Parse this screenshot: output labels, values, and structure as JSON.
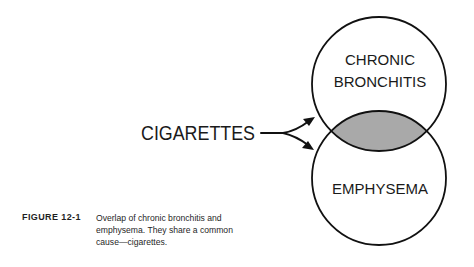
{
  "figure": {
    "number": "FIGURE 12-1",
    "caption": "Overlap of chronic bronchitis and emphysema. They share a common cause—cigarettes."
  },
  "diagram": {
    "type": "venn",
    "cause_label": "CIGARETTES",
    "sets": [
      {
        "id": "top",
        "label_lines": [
          "CHRONIC",
          "BRONCHITIS"
        ]
      },
      {
        "id": "bottom",
        "label_lines": [
          "EMPHYSEMA"
        ]
      }
    ],
    "overlap": {
      "fill": "#a9a9a9",
      "meaning": "shared condition"
    },
    "colors": {
      "stroke": "#111111",
      "background": "#ffffff",
      "overlap": "#a9a9a9"
    }
  }
}
